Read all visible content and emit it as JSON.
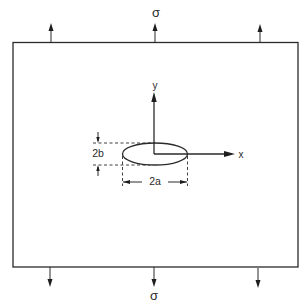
{
  "diagram": {
    "applied_stress": {
      "top_label": "σ",
      "bottom_label": "σ",
      "arrows_top": 3,
      "arrows_bottom": 3
    },
    "axes": {
      "x_label": "x",
      "y_label": "y"
    },
    "hole": {
      "shape": "ellipse",
      "width_label": "2a",
      "height_label": "2b"
    },
    "colors": {
      "ink": "#2a2a2a",
      "background": "#ffffff"
    }
  }
}
